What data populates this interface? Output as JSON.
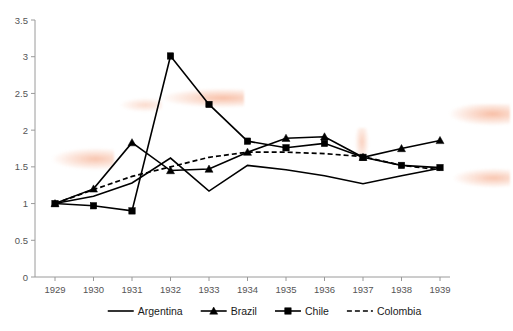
{
  "chart_data": {
    "type": "line",
    "title": "",
    "subtitle": "",
    "xlabel": "",
    "ylabel": "",
    "x": [
      1929,
      1930,
      1931,
      1932,
      1933,
      1934,
      1935,
      1936,
      1937,
      1938,
      1939
    ],
    "categories": [
      "1929",
      "1930",
      "1931",
      "1932",
      "1933",
      "1934",
      "1935",
      "1936",
      "1937",
      "1938",
      "1939"
    ],
    "xlim": [
      1929,
      1939
    ],
    "ylim": [
      0,
      3.5
    ],
    "ytick_labels": [
      "0",
      "0.5",
      "1",
      "1.5",
      "2",
      "2.5",
      "3",
      "3.5"
    ],
    "ytick_values": [
      0,
      0.5,
      1,
      1.5,
      2,
      2.5,
      3,
      3.5
    ],
    "grid": false,
    "legend_position": "bottom",
    "series": [
      {
        "name": "Argentina",
        "marker": "none",
        "linestyle": "solid",
        "color": "#000000",
        "values": [
          1.0,
          1.1,
          1.28,
          1.62,
          1.17,
          1.52,
          1.46,
          1.38,
          1.27,
          1.38,
          1.48
        ]
      },
      {
        "name": "Brazil",
        "marker": "triangle",
        "linestyle": "solid",
        "color": "#000000",
        "values": [
          1.0,
          1.2,
          1.83,
          1.45,
          1.47,
          1.7,
          1.89,
          1.91,
          1.63,
          1.75,
          1.86
        ]
      },
      {
        "name": "Chile",
        "marker": "square",
        "linestyle": "solid",
        "color": "#000000",
        "values": [
          1.0,
          0.97,
          0.9,
          3.01,
          2.35,
          1.85,
          1.76,
          1.82,
          1.63,
          1.52,
          1.49
        ]
      },
      {
        "name": "Colombia",
        "marker": "none",
        "linestyle": "dashed",
        "color": "#000000",
        "values": [
          1.0,
          1.19,
          1.37,
          1.5,
          1.63,
          1.7,
          1.7,
          1.68,
          1.64,
          1.52,
          1.46
        ]
      }
    ]
  },
  "legend": {
    "items": [
      {
        "label": "Argentina",
        "marker": "none",
        "linestyle": "solid"
      },
      {
        "label": "Brazil",
        "marker": "triangle",
        "linestyle": "solid"
      },
      {
        "label": "Chile",
        "marker": "square",
        "linestyle": "solid"
      },
      {
        "label": "Colombia",
        "marker": "none",
        "linestyle": "dashed"
      }
    ]
  },
  "axes": {
    "y_tick_labels": [
      "3.5",
      "3",
      "2.5",
      "2",
      "1.5",
      "1",
      "0.5",
      "0"
    ],
    "x_tick_labels": [
      "1929",
      "1930",
      "1931",
      "1932",
      "1933",
      "1934",
      "1935",
      "1936",
      "1937",
      "1938",
      "1939"
    ]
  },
  "colors": {
    "line": "#000000",
    "axis": "#9a9a9a",
    "tick_text": "#555555",
    "background": "#ffffff",
    "artifact": "#f3a883"
  }
}
